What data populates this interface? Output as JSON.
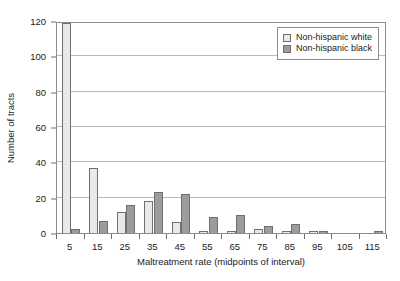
{
  "chart_data": {
    "type": "bar",
    "title": "",
    "subtitle": "",
    "xlabel": "Maltreatment rate (midpoints of interval)",
    "ylabel": "Number of tracts",
    "categories": [
      "5",
      "15",
      "25",
      "35",
      "45",
      "55",
      "65",
      "75",
      "85",
      "95",
      "105",
      "115"
    ],
    "xlim": [
      0,
      120
    ],
    "ylim": [
      0,
      120
    ],
    "yticks": [
      0,
      20,
      40,
      60,
      80,
      100,
      120
    ],
    "grid": "horizontal",
    "legend_position": "top-right",
    "series": [
      {
        "name": "Non-hispanic white",
        "color": "#e9e9e9",
        "values": [
          119,
          37,
          12,
          18,
          6,
          1,
          1,
          2,
          1,
          1,
          0,
          0
        ]
      },
      {
        "name": "Non-hispanic black",
        "color": "#9c9c9c",
        "values": [
          2,
          7,
          16,
          23,
          22,
          9,
          10,
          4,
          5,
          1,
          0,
          1
        ]
      }
    ]
  },
  "legend": {
    "items": [
      {
        "label": "Non-hispanic white",
        "swatch": "white"
      },
      {
        "label": "Non-hispanic black",
        "swatch": "black"
      }
    ]
  },
  "axes": {
    "y_title": "Number of tracts",
    "x_title": "Maltreatment rate (midpoints of interval)",
    "y_tick_labels": [
      "0",
      "20",
      "40",
      "60",
      "80",
      "100",
      "120"
    ],
    "x_tick_labels": [
      "5",
      "15",
      "25",
      "35",
      "45",
      "55",
      "65",
      "75",
      "85",
      "95",
      "105",
      "115"
    ]
  },
  "style": {
    "frame_color": "#8c8c8c",
    "grid_color": "#b9b9b9",
    "bar_border": "#6f6f6f",
    "text_color": "#1a1a1a",
    "background": "#ffffff"
  }
}
